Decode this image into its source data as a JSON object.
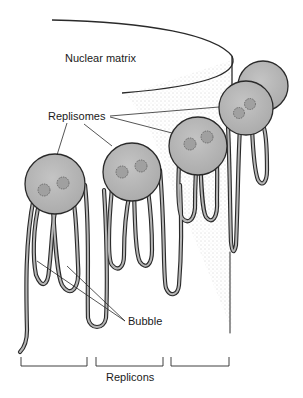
{
  "labels": {
    "nuclear_matrix": "Nuclear matrix",
    "replisomes": "Replisomes",
    "bubble": "Bubble",
    "replicons": "Replicons"
  },
  "colors": {
    "sphere_fill": "#b8b8b8",
    "outline": "#2a2a2a",
    "dna_fill": "#a8a8a8",
    "stipple": "#9a9a9a",
    "background": "#ffffff"
  },
  "replisome_count": 5,
  "replicon_bracket_count": 3
}
